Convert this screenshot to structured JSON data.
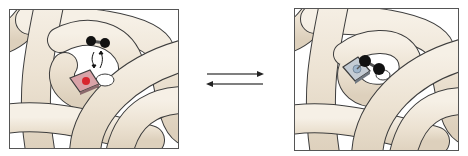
{
  "figure": {
    "description": "Protein chain with heme pocket reversibly binding an O2 molecule",
    "left_panel": {
      "label": "Unbound state: O2 approaching heme (iron shown red)",
      "heme_color": "#d9a3a8",
      "iron_color": "#d8262f",
      "ligand_color": "#111111",
      "chain_color": "#efe6d8"
    },
    "equilibrium": {
      "label": "Reversible equilibrium",
      "forward_arrow": "→",
      "reverse_arrow": "←",
      "arrow_color": "#555555"
    },
    "right_panel": {
      "label": "Bound state: O2 bound to heme (iron shown blue)",
      "heme_color": "#c4ccd4",
      "iron_color": "#9fb6cc",
      "ligand_color": "#111111",
      "chain_color": "#efe6d8"
    }
  }
}
